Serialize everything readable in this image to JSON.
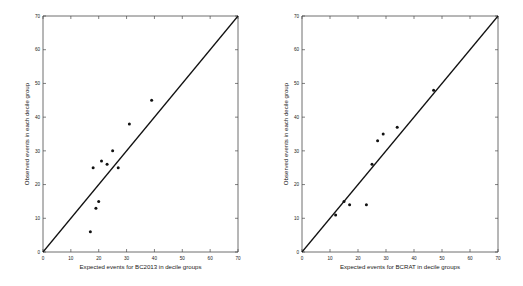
{
  "figure": {
    "background": "#ffffff",
    "marker_color": "#111111",
    "line_color": "#111111",
    "axis_color": "#4a4a4a"
  },
  "chart_data": [
    {
      "type": "scatter",
      "panel": "left",
      "title": "",
      "xlabel": "Expected events for  BC2013 in decile groups",
      "ylabel": "Observed events in each decile group",
      "xlim": [
        0,
        70
      ],
      "ylim": [
        0,
        70
      ],
      "xticks": [
        0,
        10,
        20,
        30,
        40,
        50,
        60,
        70
      ],
      "yticks": [
        0,
        10,
        20,
        30,
        40,
        50,
        60,
        70
      ],
      "xticklabels": [
        "0",
        "10",
        "20",
        "30",
        "40",
        "50",
        "60",
        "70"
      ],
      "yticklabels": [
        "0",
        "10",
        "20",
        "30",
        "40",
        "50",
        "60",
        "70"
      ],
      "grid": false,
      "legend": "none",
      "annotations": [
        "identity line y = x drawn from (0,0) to (70,70)"
      ],
      "reference_line": {
        "name": "identity",
        "from": [
          0,
          0
        ],
        "to": [
          70,
          70
        ]
      },
      "x": [
        17,
        19,
        20,
        18,
        21,
        23,
        25,
        27,
        31,
        39
      ],
      "y": [
        6,
        13,
        15,
        25,
        27,
        26,
        30,
        25,
        38,
        45
      ]
    },
    {
      "type": "scatter",
      "panel": "right",
      "title": "",
      "xlabel": "Expected events for  BCRAT in decile groups",
      "ylabel": "Observed events in each decile group",
      "xlim": [
        0,
        70
      ],
      "ylim": [
        0,
        70
      ],
      "xticks": [
        0,
        10,
        20,
        30,
        40,
        50,
        60,
        70
      ],
      "yticks": [
        0,
        10,
        20,
        30,
        40,
        50,
        60,
        70
      ],
      "xticklabels": [
        "0",
        "10",
        "20",
        "30",
        "40",
        "50",
        "60",
        "70"
      ],
      "yticklabels": [
        "0",
        "10",
        "20",
        "30",
        "40",
        "50",
        "60",
        "70"
      ],
      "grid": false,
      "legend": "none",
      "annotations": [
        "identity line y = x drawn from (0,0) to (70,70)"
      ],
      "reference_line": {
        "name": "identity",
        "from": [
          0,
          0
        ],
        "to": [
          70,
          70
        ]
      },
      "x": [
        12,
        15,
        17,
        23,
        25,
        27,
        29,
        34,
        47
      ],
      "y": [
        11,
        15,
        14,
        14,
        26,
        33,
        35,
        37,
        48
      ]
    }
  ]
}
